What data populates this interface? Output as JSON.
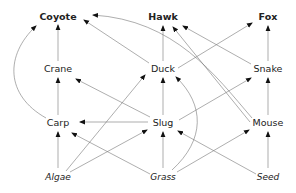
{
  "diagram": {
    "type": "food-web",
    "colors": {
      "edge": "#777777",
      "text": "#222222",
      "arrow": "#111111",
      "background": "#ffffff"
    },
    "nodes": [
      {
        "id": "coyote",
        "label": "Coyote",
        "x": 58,
        "y": 16,
        "style": "bold"
      },
      {
        "id": "hawk",
        "label": "Hawk",
        "x": 163,
        "y": 16,
        "style": "bold"
      },
      {
        "id": "fox",
        "label": "Fox",
        "x": 268,
        "y": 16,
        "style": "bold"
      },
      {
        "id": "crane",
        "label": "Crane",
        "x": 58,
        "y": 68,
        "style": "normal"
      },
      {
        "id": "duck",
        "label": "Duck",
        "x": 163,
        "y": 68,
        "style": "normal"
      },
      {
        "id": "snake",
        "label": "Snake",
        "x": 268,
        "y": 68,
        "style": "normal"
      },
      {
        "id": "carp",
        "label": "Carp",
        "x": 58,
        "y": 122,
        "style": "normal"
      },
      {
        "id": "slug",
        "label": "Slug",
        "x": 163,
        "y": 122,
        "style": "normal"
      },
      {
        "id": "mouse",
        "label": "Mouse",
        "x": 268,
        "y": 122,
        "style": "normal"
      },
      {
        "id": "algae",
        "label": "Algae",
        "x": 58,
        "y": 176,
        "style": "italic"
      },
      {
        "id": "grass",
        "label": "Grass",
        "x": 163,
        "y": 176,
        "style": "italic"
      },
      {
        "id": "seed",
        "label": "Seed",
        "x": 268,
        "y": 176,
        "style": "italic"
      }
    ],
    "edges": [
      {
        "from": "crane",
        "to": "coyote",
        "path": "M58,61 L58,25"
      },
      {
        "from": "carp",
        "to": "coyote",
        "path": "M46,118 C5,95 5,55 36,26"
      },
      {
        "from": "duck",
        "to": "coyote",
        "path": "M149,63 L84,20"
      },
      {
        "from": "mouse",
        "to": "coyote",
        "path": "M252,118 C215,75 175,20 93,15"
      },
      {
        "from": "duck",
        "to": "hawk",
        "path": "M163,61 L163,26"
      },
      {
        "from": "mouse",
        "to": "hawk",
        "path": "M250,122 L173,27"
      },
      {
        "from": "snake",
        "to": "hawk",
        "path": "M251,64 L183,26"
      },
      {
        "from": "duck",
        "to": "fox",
        "path": "M178,68 L252,23"
      },
      {
        "from": "snake",
        "to": "fox",
        "path": "M268,61 L268,26"
      },
      {
        "from": "carp",
        "to": "crane",
        "path": "M58,115 L58,78"
      },
      {
        "from": "slug",
        "to": "crane",
        "path": "M150,117 L76,79"
      },
      {
        "from": "slug",
        "to": "duck",
        "path": "M163,115 L163,78"
      },
      {
        "from": "slug",
        "to": "carp",
        "path": "M148,122 L80,122"
      },
      {
        "from": "slug",
        "to": "snake",
        "path": "M179,120 L251,78"
      },
      {
        "from": "mouse",
        "to": "snake",
        "path": "M268,115 L268,78"
      },
      {
        "from": "algae",
        "to": "carp",
        "path": "M58,168 L58,132"
      },
      {
        "from": "algae",
        "to": "duck",
        "path": "M66,171 L145,75"
      },
      {
        "from": "algae",
        "to": "slug",
        "path": "M70,172 L147,130"
      },
      {
        "from": "grass",
        "to": "carp",
        "path": "M150,174 L72,133"
      },
      {
        "from": "grass",
        "to": "slug",
        "path": "M163,168 L163,132"
      },
      {
        "from": "grass",
        "to": "duck",
        "path": "M172,170 C205,140 205,105 176,77"
      },
      {
        "from": "grass",
        "to": "mouse",
        "path": "M177,172 L249,130"
      },
      {
        "from": "seed",
        "to": "slug",
        "path": "M256,174 L178,131"
      },
      {
        "from": "seed",
        "to": "mouse",
        "path": "M268,168 L268,132"
      }
    ]
  }
}
